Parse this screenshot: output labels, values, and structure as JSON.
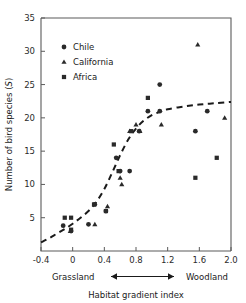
{
  "chart_data": {
    "type": "scatter",
    "title": "",
    "xlabel": "Habitat gradient index",
    "ylabel": "Number of bird species (S)",
    "ylabel_plain": "Number of bird species (",
    "ylabel_italic": "S",
    "ylabel_close": ")",
    "xlim": [
      -0.4,
      2.0
    ],
    "ylim": [
      0,
      35
    ],
    "xticks": [
      -0.4,
      0,
      0.4,
      0.8,
      1.2,
      1.6,
      2.0
    ],
    "xtick_labels": [
      "-0.4",
      "0",
      "0.4",
      "0.8",
      "1.2",
      "1.6",
      "2.0"
    ],
    "yticks": [
      5,
      10,
      15,
      20,
      25,
      30,
      35
    ],
    "ytick_labels": [
      "5",
      "10",
      "15",
      "20",
      "25",
      "30",
      "35"
    ],
    "grid": false,
    "legend_position": "upper-left-inside",
    "axis_endpoint_left": "Grassland",
    "axis_endpoint_right": "Woodland",
    "series": [
      {
        "name": "Chile",
        "marker": "circle",
        "color": "#2a2a2a",
        "points": [
          [
            -0.12,
            3.8
          ],
          [
            -0.02,
            3.0
          ],
          [
            0.2,
            4.0
          ],
          [
            0.28,
            7.0
          ],
          [
            0.42,
            6.0
          ],
          [
            0.55,
            14.0
          ],
          [
            0.6,
            12.0
          ],
          [
            0.72,
            12.0
          ],
          [
            0.84,
            18.0
          ],
          [
            0.95,
            21.0
          ],
          [
            1.1,
            25.0
          ],
          [
            1.1,
            21.0
          ],
          [
            1.55,
            18.0
          ],
          [
            1.7,
            21.0
          ]
        ]
      },
      {
        "name": "California",
        "marker": "triangle",
        "color": "#2a2a2a",
        "points": [
          [
            -0.03,
            3.0
          ],
          [
            0.28,
            4.0
          ],
          [
            0.44,
            6.7
          ],
          [
            0.6,
            11.0
          ],
          [
            0.62,
            10.0
          ],
          [
            0.72,
            18.0
          ],
          [
            0.8,
            19.0
          ],
          [
            0.85,
            18.0
          ],
          [
            1.12,
            19.0
          ],
          [
            1.58,
            31.0
          ],
          [
            1.92,
            20.0
          ]
        ]
      },
      {
        "name": "Africa",
        "marker": "square",
        "color": "#2a2a2a",
        "points": [
          [
            -0.1,
            5.0
          ],
          [
            -0.02,
            5.0
          ],
          [
            -0.02,
            3.2
          ],
          [
            0.27,
            7.0
          ],
          [
            0.42,
            6.0
          ],
          [
            0.52,
            16.0
          ],
          [
            0.58,
            12.0
          ],
          [
            0.74,
            18.0
          ],
          [
            0.95,
            23.0
          ],
          [
            1.55,
            11.0
          ],
          [
            1.82,
            14.0
          ]
        ]
      }
    ],
    "fit_curve": {
      "style": "dashed",
      "description": "sigmoid trend line",
      "points": [
        [
          -0.4,
          1.3
        ],
        [
          -0.3,
          1.9
        ],
        [
          -0.2,
          2.6
        ],
        [
          -0.1,
          3.3
        ],
        [
          0.0,
          4.1
        ],
        [
          0.1,
          5.0
        ],
        [
          0.2,
          6.0
        ],
        [
          0.3,
          7.4
        ],
        [
          0.4,
          9.3
        ],
        [
          0.5,
          11.8
        ],
        [
          0.6,
          14.4
        ],
        [
          0.7,
          16.7
        ],
        [
          0.8,
          18.4
        ],
        [
          0.9,
          19.6
        ],
        [
          1.0,
          20.4
        ],
        [
          1.1,
          20.9
        ],
        [
          1.2,
          21.3
        ],
        [
          1.4,
          21.7
        ],
        [
          1.6,
          22.0
        ],
        [
          1.8,
          22.2
        ],
        [
          2.0,
          22.4
        ]
      ]
    }
  },
  "legend": {
    "items": [
      {
        "label": "Chile",
        "marker": "circle"
      },
      {
        "label": "California",
        "marker": "triangle"
      },
      {
        "label": "Africa",
        "marker": "square"
      }
    ]
  }
}
